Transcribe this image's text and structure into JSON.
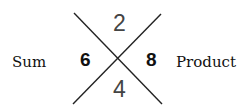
{
  "diagram": {
    "type": "x-factor-puzzle",
    "left_label": "Sum",
    "right_label": "Product",
    "top_value": "2",
    "bottom_value": "4",
    "left_value": "6",
    "right_value": "8",
    "line_color": "#222222"
  }
}
